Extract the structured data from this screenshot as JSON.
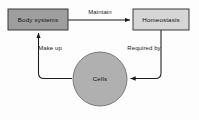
{
  "diagram": {
    "type": "cycle-flow-diagram",
    "background_color": "#fdfdfd",
    "nodes": [
      {
        "id": "body-systems",
        "label": "Body systems",
        "shape": "rectangle",
        "fill_color": "#9e9e9e",
        "border_color": "#3a3a3a",
        "x": 8,
        "y": 9,
        "width": 60,
        "height": 21
      },
      {
        "id": "homeostasis",
        "label": "Homeostasis",
        "shape": "rectangle",
        "fill_color": "#d6d6d6",
        "border_color": "#3a3a3a",
        "x": 133,
        "y": 9,
        "width": 56,
        "height": 21
      },
      {
        "id": "cells",
        "label": "Cells",
        "shape": "circle",
        "fill_color": "#b0b0b0",
        "border_color": "#6f6f6f",
        "cx": 100,
        "cy": 79,
        "r": 27
      }
    ],
    "edges": [
      {
        "id": "maintain-edge",
        "label": "Maintain",
        "from": "body-systems",
        "to": "homeostasis",
        "direction": "right",
        "label_x": 100,
        "label_y": 12
      },
      {
        "id": "required-by-edge",
        "label": "Required by",
        "from": "homeostasis",
        "to": "cells",
        "direction": "left",
        "label_x": 144,
        "label_y": 48
      },
      {
        "id": "make-up-edge",
        "label": "Make up",
        "from": "cells",
        "to": "body-systems",
        "direction": "up",
        "label_x": 50,
        "label_y": 48
      }
    ],
    "arrow_color": "#1b1b1b"
  }
}
